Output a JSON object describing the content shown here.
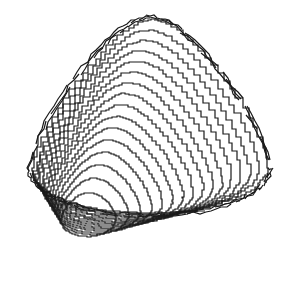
{
  "figure": {
    "background": "#ffffff",
    "stroke_color": "#1a1a1a",
    "stroke_width": 1.2
  },
  "contours": {
    "center_x": 82,
    "center_y": 225,
    "count": 16
  }
}
